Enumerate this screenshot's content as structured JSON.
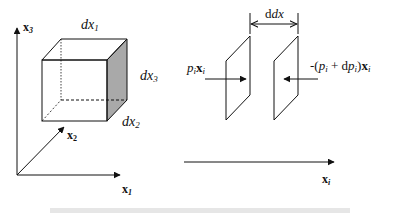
{
  "left_figure": {
    "axes": {
      "x1": {
        "label": "x",
        "sub": "1"
      },
      "x2": {
        "label": "x",
        "sub": "2"
      },
      "x3": {
        "label": "x",
        "sub": "3"
      }
    },
    "cube": {
      "edge_top": {
        "label": "dx",
        "sub": "1"
      },
      "edge_right": {
        "label": "dx",
        "sub": "3"
      },
      "edge_depth": {
        "label": "dx",
        "sub": "2"
      },
      "shaded_face_color": "#a9a9a9"
    }
  },
  "right_figure": {
    "spacing": {
      "label": "dx",
      "sub": "i"
    },
    "left_force": {
      "p": "p",
      "p_sub": "i",
      "x": "x",
      "x_sub": "i"
    },
    "right_force": {
      "prefix": "-(",
      "p": "p",
      "p_sub": "i",
      "plus": " + d",
      "dp": "p",
      "dp_sub": "i",
      "close": ")",
      "x": "x",
      "x_sub": "i"
    },
    "axis": {
      "label": "x",
      "sub": "i"
    }
  },
  "caption": {
    "visible": "clipped and illegible"
  }
}
